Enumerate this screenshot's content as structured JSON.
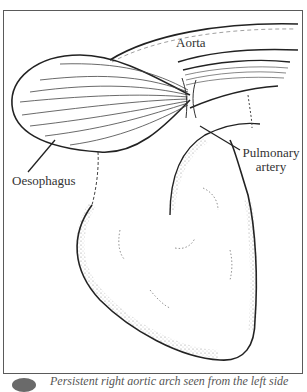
{
  "figure": {
    "labels": {
      "aorta": "Aorta",
      "pulmonary_artery_line1": "Pulmonary",
      "pulmonary_artery_line2": "artery",
      "oesophagus": "Oesophagus"
    },
    "caption": "Persistent right aortic arch seen from the left side",
    "colors": {
      "line": "#333333",
      "frame": "#5a5a5a",
      "background": "#ffffff"
    }
  }
}
